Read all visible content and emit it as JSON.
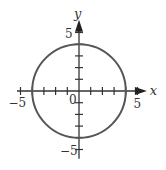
{
  "chart_data": {
    "type": "line",
    "title": "",
    "shape": "circle",
    "center": [
      0,
      0
    ],
    "radius": 4,
    "equation": "x^2 + y^2 = 16",
    "xlabel": "x",
    "ylabel": "y",
    "xlim": [
      -5.3,
      5.8
    ],
    "ylim": [
      -5.8,
      6.1
    ],
    "tick_step": 1,
    "x_ticks": [
      -5,
      -4,
      -3,
      -2,
      -1,
      1,
      2,
      3,
      4,
      5
    ],
    "y_ticks": [
      -5,
      -4,
      -3,
      -2,
      -1,
      1,
      2,
      3,
      4,
      5
    ],
    "tick_labels": {
      "x_neg": "−5",
      "x_pos": "5",
      "origin": "0",
      "y_pos": "5",
      "y_neg": "−5"
    },
    "grid": false,
    "legend": null,
    "colors": {
      "axis": "#333333",
      "curve": "#555555"
    }
  },
  "labels": {
    "x_axis": "x",
    "y_axis": "y",
    "origin": "0",
    "x_neg": "−5",
    "x_pos": "5",
    "y_pos": "5",
    "y_neg": "−5"
  }
}
